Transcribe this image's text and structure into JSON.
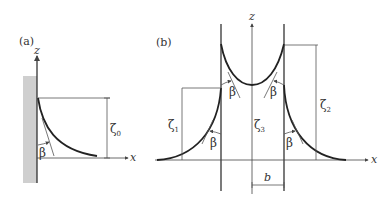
{
  "panel_a": {
    "label": "(a)",
    "z_axis_label": "z",
    "x_axis_label": "x",
    "angle_label": "β",
    "height_label": "ζ",
    "height_subscript": "0"
  },
  "panel_b": {
    "label": "(b)",
    "z_axis_label": "z",
    "x_axis_label": "x",
    "angle_labels": [
      "β",
      "β",
      "β",
      "β"
    ],
    "heights": [
      {
        "symbol": "ζ",
        "subscript": "1"
      },
      {
        "symbol": "ζ",
        "subscript": "3"
      },
      {
        "symbol": "ζ",
        "subscript": "2"
      }
    ],
    "gap_label": "b"
  },
  "colors": {
    "wall_fill": "#cfcfcf",
    "line": "#222222"
  }
}
